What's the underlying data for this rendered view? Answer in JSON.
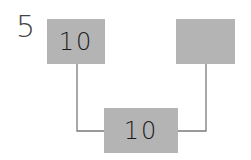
{
  "puzzle": {
    "number_label": "5",
    "nodes": [
      {
        "id": "top-left",
        "value": "10"
      },
      {
        "id": "top-right",
        "value": ""
      },
      {
        "id": "bottom",
        "value": "10"
      }
    ],
    "colors": {
      "box_fill": "#b4b4b4",
      "line": "#7a7a7a",
      "text": "#1a1a1a",
      "label": "#444444"
    }
  }
}
